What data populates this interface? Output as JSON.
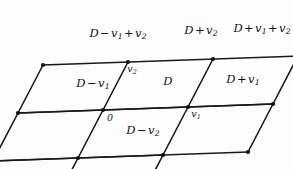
{
  "figure": {
    "type": "lattice-tiling-diagram",
    "background_color": "#fdfdfd",
    "line_color": "#1a1a1a",
    "vertex_color": "#111111",
    "text_color": "#111111",
    "geometry": {
      "cell_width": 85,
      "row_height": 48,
      "row_shift_x": -25,
      "top_edge_slope_y": 3,
      "origin_x": 103,
      "origin_y": 110,
      "stroke_width": 1.6,
      "vertex_radius": 2.1
    },
    "rows": [
      {
        "row_index": 0,
        "cells": [
          {
            "label": "D - v1 + v2",
            "parts": [
              "D",
              "-",
              "v",
              "1",
              "+",
              "v",
              "2"
            ],
            "cx": 118,
            "cy": 34
          },
          {
            "label": "D + v2",
            "parts": [
              "D",
              "+",
              "v",
              "2"
            ],
            "cx": 201,
            "cy": 31
          },
          {
            "label": "D + v1 + v2",
            "parts": [
              "D",
              "+",
              "v",
              "1",
              "+",
              "v",
              "2"
            ],
            "cx": 262,
            "cy": 29
          }
        ]
      },
      {
        "row_index": 1,
        "cells": [
          {
            "label": "D - v1",
            "parts": [
              "D",
              "-",
              "v",
              "1"
            ],
            "cx": 93,
            "cy": 84
          },
          {
            "label": "D",
            "parts": [
              "D"
            ],
            "cx": 168,
            "cy": 82
          },
          {
            "label": "D + v1",
            "parts": [
              "D",
              "+",
              "v",
              "1"
            ],
            "cx": 243,
            "cy": 80
          }
        ]
      },
      {
        "row_index": 2,
        "cells": [
          {
            "label": "",
            "parts": [],
            "cx": 55,
            "cy": 133
          },
          {
            "label": "D - v2",
            "parts": [
              "D",
              "-",
              "v",
              "2"
            ],
            "cx": 143,
            "cy": 131
          }
        ]
      }
    ],
    "vertex_labels": [
      {
        "name": "v2",
        "base": "v",
        "sub": "2",
        "x": 132,
        "y": 70
      },
      {
        "name": "origin",
        "base": "0",
        "sub": "",
        "x": 110,
        "y": 118
      },
      {
        "name": "v1",
        "base": "v",
        "sub": "1",
        "x": 196,
        "y": 115
      }
    ]
  }
}
